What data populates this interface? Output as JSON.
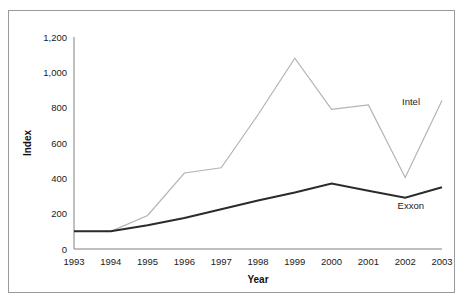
{
  "chart_data": {
    "type": "line",
    "title": "",
    "xlabel": "Year",
    "ylabel": "Index",
    "x": [
      1993,
      1994,
      1995,
      1996,
      1997,
      1998,
      1999,
      2000,
      2001,
      2002,
      2003
    ],
    "xticklabels": [
      "1993",
      "1994",
      "1995",
      "1996",
      "1997",
      "1998",
      "1999",
      "2000",
      "2001",
      "2002",
      "2003"
    ],
    "yticks": [
      0,
      200,
      400,
      600,
      800,
      1000,
      1200
    ],
    "yticklabels": [
      "0",
      "200",
      "400",
      "600",
      "800",
      "1,000",
      "1,200"
    ],
    "ylim": [
      0,
      1200
    ],
    "xlim": [
      1993,
      2003
    ],
    "grid": false,
    "legend_position": "inline-end-of-line",
    "series": [
      {
        "name": "Intel",
        "color": "#b3b3b3",
        "linewidth": 1.2,
        "values": [
          100,
          100,
          190,
          430,
          460,
          760,
          1080,
          790,
          815,
          405,
          840
        ]
      },
      {
        "name": "Exxon",
        "color": "#2b2b2b",
        "linewidth": 2.0,
        "values": [
          100,
          100,
          135,
          175,
          225,
          275,
          320,
          370,
          330,
          290,
          350
        ]
      }
    ],
    "annotations": [
      {
        "text": "Intel",
        "series": "Intel",
        "at_x": 2003
      },
      {
        "text": "Exxon",
        "series": "Exxon",
        "at_x": 2003
      }
    ]
  },
  "figure": {
    "border_color": "#9a9a9a",
    "background": "#ffffff"
  }
}
